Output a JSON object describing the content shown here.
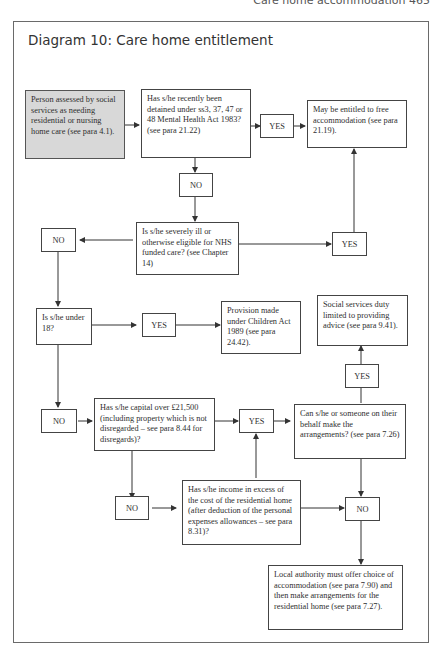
{
  "page": {
    "running_head": "Care home accommodation 465"
  },
  "diagram": {
    "title": "Diagram 10: Care home entitlement",
    "nodes": {
      "start": "Person assessed by social services as needing residential or nursing home care (see para 4.1).",
      "detained_q": "Has s/he recently been detained under ss3, 37, 47 or 48 Mental Health Act 1983? (see para 21.22)",
      "free_accommodation": "May be entitled to free accommodation (see para 21.19).",
      "nhs_q": "Is s/he severely ill or otherwise eligible for NHS funded care? (see Chapter 14)",
      "under18_q": "Is s/he under 18?",
      "children_act": "Provision made under Children Act 1989 (see para 24.42).",
      "advice_only": "Social services duty limited to providing advice (see para 9.41).",
      "capital_q": "Has s/he capital over £21,500 (including property which is not disregarded – see para 8.44 for disregards)?",
      "arrangements_q": "Can s/he or someone on their behalf make the arrangements? (see para 7.26)",
      "income_q": "Has s/he income in excess of the cost of the residential home (after deduction of the personal expenses allowances – see para 8.31)?",
      "local_authority": "Local authority must offer choice of accommodation (see para 7.90) and then make arrangements for the residential home (see para 7.27)."
    },
    "labels": {
      "yes_detained": "YES",
      "no_detained": "NO",
      "no_nhs": "NO",
      "yes_nhs": "YES",
      "yes_under18": "YES",
      "no_under18": "NO",
      "yes_capital": "YES",
      "no_capital": "NO",
      "yes_arrangements": "YES",
      "no_arrangements": "NO"
    }
  }
}
